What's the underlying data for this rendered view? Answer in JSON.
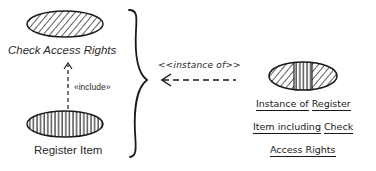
{
  "diagram": {
    "left_group": {
      "top_use_case": {
        "label": "Check Access Rights",
        "fill": "diagonal-hatch"
      },
      "bottom_use_case": {
        "label": "Register Item",
        "fill": "vertical-hatch"
      },
      "relationship": {
        "label": "«include»",
        "style": "dashed-arrow",
        "direction": "Register Item -> Check Access Rights"
      }
    },
    "brace": {
      "icon": "curly-brace-right"
    },
    "instance_relation": {
      "label": "<<instance of>>",
      "style": "dashed-arrow",
      "direction": "instance -> group"
    },
    "instance": {
      "fill": "diagonal-vertical-diagonal-hatch",
      "caption_lines": [
        {
          "parts": [
            "Instance of",
            " ",
            "Register"
          ]
        },
        {
          "parts": [
            "Item including",
            " ",
            "Check"
          ]
        },
        {
          "parts": [
            "Access Rights"
          ]
        }
      ]
    },
    "colors": {
      "ink": "#1a1a1a",
      "background": "#ffffff"
    }
  }
}
